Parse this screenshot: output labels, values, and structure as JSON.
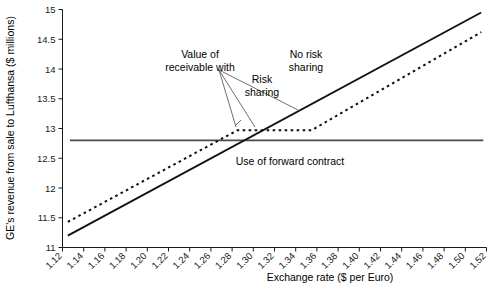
{
  "chart_data": {
    "type": "line",
    "title": "",
    "xlabel": "Exchange rate ($ per Euro)",
    "ylabel": "GE's revenue from sale to Lufthansa ($ millions)",
    "xlim": [
      1.12,
      1.52
    ],
    "ylim": [
      11,
      15
    ],
    "grid": false,
    "legend": "none",
    "xticks": [
      "1.12",
      "1.14",
      "1.16",
      "1.18",
      "1.20",
      "1.22",
      "1.24",
      "1.26",
      "1.28",
      "1.30",
      "1.32",
      "1.34",
      "1.36",
      "1.38",
      "1.40",
      "1.42",
      "1.44",
      "1.46",
      "1.48",
      "1.50",
      "1.52"
    ],
    "yticks": [
      "11",
      "11.5",
      "12",
      "12.5",
      "13",
      "13.5",
      "14",
      "14.5",
      "15"
    ],
    "series": [
      {
        "name": "No risk sharing",
        "style": "solid",
        "x": [
          1.125,
          1.515
        ],
        "values": [
          11.2,
          14.95
        ]
      },
      {
        "name": "Risk sharing",
        "style": "dotted",
        "x": [
          1.125,
          1.285,
          1.355,
          1.515
        ],
        "values": [
          11.43,
          12.97,
          12.97,
          14.62
        ]
      },
      {
        "name": "Use of forward contract",
        "style": "flat-solid",
        "x": [
          1.127,
          1.517
        ],
        "values": [
          12.8,
          12.8
        ]
      }
    ],
    "annotations": [
      {
        "name": "value-of-receivable-with",
        "text_lines": [
          "Value of",
          "receivable with"
        ],
        "x": 1.2085,
        "y": 14.33
      },
      {
        "name": "no-risk-sharing",
        "text_lines": [
          "No risk",
          "sharing"
        ],
        "x": 1.3305,
        "y": 14.33
      },
      {
        "name": "risk-sharing",
        "text_lines": [
          "Risk",
          "sharing"
        ],
        "x": 1.2885,
        "y": 13.69
      },
      {
        "name": "use-of-forward-contract",
        "text_lines": [
          "Use of forward contract"
        ],
        "x": 1.3245,
        "y": 12.47
      }
    ]
  },
  "labels": {
    "x_axis_title": "Exchange rate ($ per Euro)",
    "y_axis_title": "GE's revenue from sale to Lufthansa ($ millions)",
    "annot_value_line1": "Value of",
    "annot_value_line2": "receivable with",
    "annot_norisk_line1": "No risk",
    "annot_norisk_line2": "sharing",
    "annot_risk_line1": "Risk",
    "annot_risk_line2": "sharing",
    "annot_forward": "Use of forward contract"
  },
  "colors": {
    "axis": "#1a1a1a",
    "series_solid": "#111111",
    "series_dotted": "#111111",
    "series_flat": "#4a4a4a",
    "leader": "#4a4a4a",
    "background": "#ffffff"
  }
}
